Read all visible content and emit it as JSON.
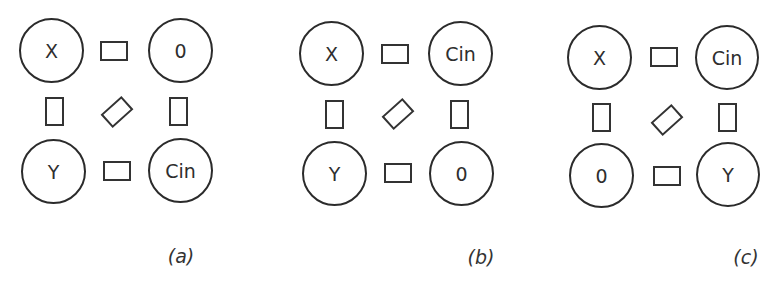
{
  "figure": {
    "panels": [
      {
        "caption": "(a)",
        "nodes": {
          "top_left": "X",
          "top_right": "0",
          "bottom_left": "Y",
          "bottom_right": "Cin"
        }
      },
      {
        "caption": "(b)",
        "nodes": {
          "top_left": "X",
          "top_right": "Cin",
          "bottom_left": "Y",
          "bottom_right": "0"
        }
      },
      {
        "caption": "(c)",
        "nodes": {
          "top_left": "X",
          "top_right": "Cin",
          "bottom_left": "0",
          "bottom_right": "Y"
        }
      }
    ],
    "colors": {
      "stroke": "#2b2b2b",
      "text": "#2e2e2e",
      "background": "#ffffff"
    }
  }
}
